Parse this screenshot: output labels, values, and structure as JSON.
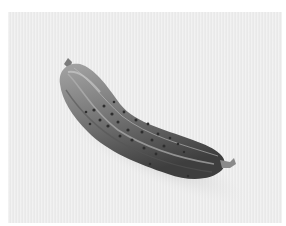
{
  "image": {
    "subject": "cucumber",
    "description": "Grayscale photo of a single bumpy cucumber lying diagonally on a light textured background",
    "colors": {
      "border": "#ffffff",
      "background": "#ebebeb",
      "cucumber_light": "#9a9a9a",
      "cucumber_mid": "#6e6e6e",
      "cucumber_dark": "#3c3c3c",
      "shadow": "#cfcfcf"
    }
  }
}
